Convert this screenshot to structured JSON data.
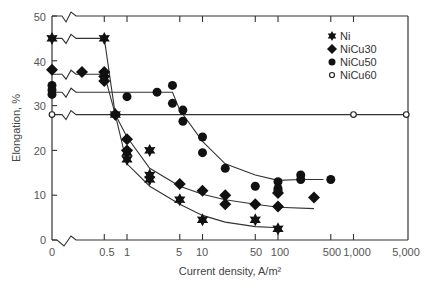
{
  "chart_data": {
    "type": "scatter",
    "title": "",
    "xlabel": "Current density, A/m²",
    "ylabel": "Elongation, %",
    "xscale": "log (with broken axis at 0)",
    "x_ticks": [
      "0",
      "0.5",
      "1",
      "5",
      "10",
      "50",
      "100",
      "500",
      "1,000",
      "5,000"
    ],
    "y_ticks": [
      "0",
      "10",
      "20",
      "30",
      "40",
      "50"
    ],
    "ylim": [
      0,
      50
    ],
    "grid": false,
    "legend_position": "upper right inside",
    "series": [
      {
        "name": "Ni",
        "marker": "star",
        "points": [
          [
            0,
            45
          ],
          [
            0.5,
            45
          ],
          [
            0.7,
            28
          ],
          [
            1,
            19.5
          ],
          [
            1,
            18
          ],
          [
            2,
            20
          ],
          [
            2,
            14.5
          ],
          [
            2,
            13.5
          ],
          [
            5,
            9
          ],
          [
            10,
            4.5
          ],
          [
            50,
            4.5
          ],
          [
            100,
            2.5
          ]
        ],
        "fit_line": [
          [
            0,
            45
          ],
          [
            0.5,
            45
          ],
          [
            0.7,
            28
          ],
          [
            1,
            17
          ],
          [
            2,
            12
          ],
          [
            5,
            8
          ],
          [
            10,
            5.5
          ],
          [
            20,
            4
          ],
          [
            50,
            3
          ],
          [
            90,
            2.8
          ]
        ]
      },
      {
        "name": "NiCu30",
        "marker": "diamond",
        "points": [
          [
            0,
            38
          ],
          [
            0.3,
            37.5
          ],
          [
            0.5,
            37.5
          ],
          [
            0.5,
            36.5
          ],
          [
            0.5,
            35.5
          ],
          [
            0.7,
            28
          ],
          [
            1,
            22.5
          ],
          [
            1,
            20
          ],
          [
            5,
            12.5
          ],
          [
            10,
            11
          ],
          [
            20,
            10
          ],
          [
            20,
            8
          ],
          [
            50,
            8
          ],
          [
            100,
            7.5
          ],
          [
            100,
            10.5
          ],
          [
            300,
            9.5
          ]
        ],
        "fit_line": [
          [
            0,
            37
          ],
          [
            0.5,
            37
          ],
          [
            0.7,
            28
          ],
          [
            1,
            23
          ],
          [
            2,
            16
          ],
          [
            5,
            12
          ],
          [
            10,
            10.2
          ],
          [
            20,
            9
          ],
          [
            50,
            8
          ],
          [
            100,
            7.3
          ],
          [
            300,
            7
          ]
        ]
      },
      {
        "name": "NiCu50",
        "marker": "filled-circle",
        "points": [
          [
            0,
            34.5
          ],
          [
            0,
            33.5
          ],
          [
            0,
            32.5
          ],
          [
            1,
            32
          ],
          [
            2.5,
            33
          ],
          [
            4,
            34.5
          ],
          [
            4,
            30.5
          ],
          [
            5.5,
            29
          ],
          [
            5.5,
            26.5
          ],
          [
            10,
            23
          ],
          [
            10,
            19.5
          ],
          [
            20,
            16
          ],
          [
            50,
            12
          ],
          [
            100,
            13
          ],
          [
            100,
            11.5
          ],
          [
            100,
            11
          ],
          [
            200,
            14.5
          ],
          [
            200,
            13.5
          ],
          [
            500,
            13.5
          ]
        ],
        "fit_line": [
          [
            0,
            33
          ],
          [
            4,
            33
          ],
          [
            5,
            29
          ],
          [
            10,
            22
          ],
          [
            20,
            17
          ],
          [
            50,
            14.5
          ],
          [
            100,
            13.3
          ],
          [
            200,
            13.5
          ],
          [
            400,
            13.5
          ]
        ]
      },
      {
        "name": "NiCu60",
        "marker": "open-circle",
        "points": [
          [
            0,
            28
          ],
          [
            1000,
            28
          ],
          [
            5000,
            28
          ]
        ],
        "fit_line": [
          [
            0,
            28
          ],
          [
            5000,
            28
          ]
        ]
      }
    ]
  },
  "axes": {
    "x_title": "Current density, A/m²",
    "y_title": "Elongation, %",
    "x_ticks": [
      "0",
      "0.5",
      "1",
      "5",
      "10",
      "50",
      "100",
      "500",
      "1,000",
      "5,000"
    ],
    "y_ticks": [
      "0",
      "10",
      "20",
      "30",
      "40",
      "50"
    ]
  },
  "legend": [
    {
      "label": "Ni",
      "marker": "star-icon"
    },
    {
      "label": "NiCu30",
      "marker": "diamond-icon"
    },
    {
      "label": "NiCu50",
      "marker": "filled-circle-icon"
    },
    {
      "label": "NiCu60",
      "marker": "open-circle-icon"
    }
  ]
}
